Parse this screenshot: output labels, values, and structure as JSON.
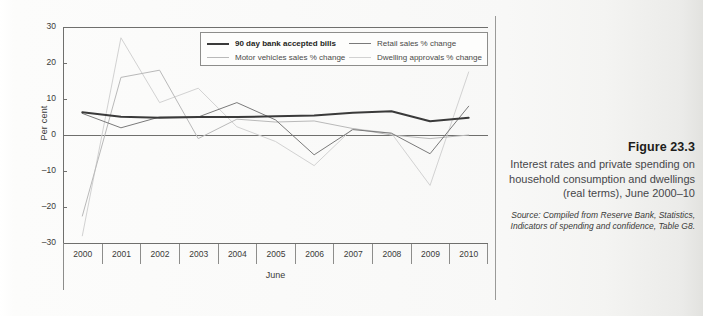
{
  "figure": {
    "number": "Figure 23.3",
    "title": "Interest rates and private spending on household consumption and dwellings (real terms), June 2000–10",
    "source": "Source: Compiled from Reserve Bank, Statistics, Indicators of spending and confidence, Table G8."
  },
  "colors": {
    "bank_bills": "#3a3a3a",
    "motor_vehicles": "#b9b9b9",
    "retail_sales": "#7a7a7a",
    "dwelling_approvals": "#d2d2d2",
    "axis": "#6f6f6d",
    "page_background": "#fbfbfa",
    "divider": "#9a9a98"
  },
  "legend": {
    "items": [
      {
        "label": "90 day bank accepted bills",
        "bold": true,
        "color_key": "bank_bills"
      },
      {
        "label": "Motor vehicles sales % change",
        "bold": false,
        "color_key": "motor_vehicles"
      },
      {
        "label": "Retail sales % change",
        "bold": false,
        "color_key": "retail_sales"
      },
      {
        "label": "Dwelling approvals % change",
        "bold": false,
        "color_key": "dwelling_approvals"
      }
    ]
  },
  "chart_data": {
    "type": "line",
    "title": "Interest rates and private spending on household consumption and dwellings (real terms), June 2000–10",
    "xlabel": "June",
    "ylabel": "Per cent",
    "categories": [
      "2000",
      "2001",
      "2002",
      "2003",
      "2004",
      "2005",
      "2006",
      "2007",
      "2008",
      "2009",
      "2010"
    ],
    "x": [
      2000,
      2001,
      2002,
      2003,
      2004,
      2005,
      2006,
      2007,
      2008,
      2009,
      2010
    ],
    "ylim": [
      -30,
      30
    ],
    "yticks": [
      30,
      20,
      10,
      0,
      -10,
      -20,
      -30
    ],
    "grid": false,
    "legend_position": "top-inside",
    "series": [
      {
        "name": "90 day bank accepted bills",
        "color": "#3a3a3a",
        "width": 2.0,
        "values": [
          6.3,
          5.1,
          4.8,
          5.0,
          5.0,
          5.2,
          5.4,
          6.2,
          6.6,
          3.8,
          4.8
        ]
      },
      {
        "name": "Motor vehicles sales % change",
        "color": "#b9b9b9",
        "width": 1.0,
        "values": [
          -22.5,
          16.0,
          18.0,
          -1.0,
          4.4,
          3.6,
          3.9,
          1.8,
          0.0,
          -1.0,
          0.0
        ]
      },
      {
        "name": "Retail sales % change",
        "color": "#7a7a7a",
        "width": 1.0,
        "values": [
          6.0,
          2.0,
          5.0,
          5.0,
          9.0,
          4.2,
          -5.5,
          1.5,
          0.5,
          -5.2,
          8.0
        ]
      },
      {
        "name": "Dwelling approvals % change",
        "color": "#d2d2d2",
        "width": 1.0,
        "values": [
          -28.0,
          27.0,
          9.0,
          13.0,
          2.3,
          -1.8,
          -8.5,
          1.8,
          0.5,
          -14.0,
          17.5
        ]
      }
    ]
  }
}
